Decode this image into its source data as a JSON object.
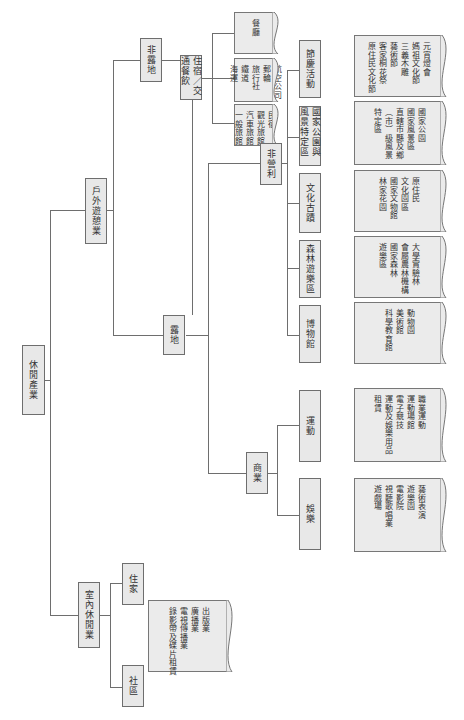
{
  "diagram": {
    "root": "休閒產業",
    "outdoor": "戶外遊憩業",
    "indoor": "室內休閒業",
    "indoor_children": [
      "住家",
      "社區"
    ],
    "indoor_leaf": "出版業\n廣播業\n電視傳播業\n錄影帶及碟片租賃",
    "non_site": "非露地",
    "lodging": "住宿／交通餐飲",
    "lodging_leaves": [
      "餐廳",
      "航空公司\n郵輪\n旅行社\n鐵道\n海運",
      "民宿\n觀光旅館\n汽車旅館\n一般旅館"
    ],
    "site": "露地",
    "nonprofit": "非營利",
    "nonprofit_children": [
      "節慶活動",
      "國家公園與風景特定區",
      "文化古蹟",
      "森林遊樂區",
      "博物館"
    ],
    "nonprofit_leaves": [
      "元宵燈會\n媽祖文化節\n三義木雕\n藝術節\n客家桐花祭\n原住民文化節",
      "國家公園\n國家風景區\n直轄市縣及鄉\n（市）級風景\n特定區",
      "原住民\n文化園區\n國家文物館\n林家花園",
      "大學實驗林\n會屬農林機構\n國家森林\n遊樂區",
      "動物園\n美術館\n科學教育館"
    ],
    "commercial": "商業",
    "commercial_children": [
      "運動",
      "娛樂"
    ],
    "commercial_leaves": [
      "職業運動\n運動場館\n電子競技\n運動及娛樂用品\n租賃",
      "藝術表演\n遊樂園\n電影院\n視聽歌唱業\n遊戲場"
    ]
  }
}
